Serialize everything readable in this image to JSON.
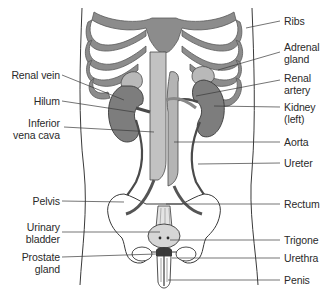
{
  "diagram": {
    "colors": {
      "bone": "#8c8c8c",
      "kidney": "#7d7d7d",
      "adrenal": "#b9b9b9",
      "vessel": "#bdbdbd",
      "vessel_outline": "#4a4a4a",
      "pelvis_fill": "#ffffff",
      "bladder": "#d6d6d6",
      "outline": "#3a3a3a",
      "leader": "#3a3a3a"
    },
    "labels_left": [
      {
        "id": "renal-vein",
        "lines": [
          "Renal vein"
        ]
      },
      {
        "id": "hilum",
        "lines": [
          "Hilum"
        ]
      },
      {
        "id": "inferior-vena-cava",
        "lines": [
          "Inferior",
          "vena cava"
        ]
      },
      {
        "id": "pelvis",
        "lines": [
          "Pelvis"
        ]
      },
      {
        "id": "urinary-bladder",
        "lines": [
          "Urinary",
          "bladder"
        ]
      },
      {
        "id": "prostate-gland",
        "lines": [
          "Prostate",
          "gland"
        ]
      }
    ],
    "labels_right": [
      {
        "id": "ribs",
        "lines": [
          "Ribs"
        ]
      },
      {
        "id": "adrenal-gland",
        "lines": [
          "Adrenal",
          "gland"
        ]
      },
      {
        "id": "renal-artery",
        "lines": [
          "Renal",
          "artery"
        ]
      },
      {
        "id": "kidney-left",
        "lines": [
          "Kidney",
          "(left)"
        ]
      },
      {
        "id": "aorta",
        "lines": [
          "Aorta"
        ]
      },
      {
        "id": "ureter",
        "lines": [
          "Ureter"
        ]
      },
      {
        "id": "rectum",
        "lines": [
          "Rectum"
        ]
      },
      {
        "id": "trigone",
        "lines": [
          "Trigone"
        ]
      },
      {
        "id": "urethra",
        "lines": [
          "Urethra"
        ]
      },
      {
        "id": "penis",
        "lines": [
          "Penis"
        ]
      }
    ]
  }
}
